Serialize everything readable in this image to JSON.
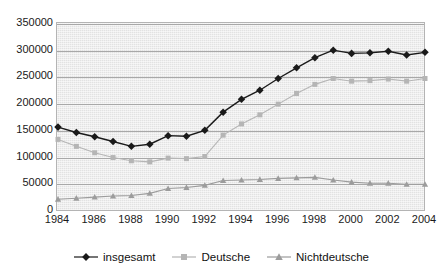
{
  "chart_data": {
    "type": "line",
    "title": "",
    "xlabel": "",
    "ylabel": "",
    "grid": true,
    "legend_position": "bottom",
    "xlim": [
      1984,
      2004
    ],
    "ylim": [
      0,
      350000
    ],
    "ytick_step": 50000,
    "xtick_step": 2,
    "x": [
      1984,
      1985,
      1986,
      1987,
      1988,
      1989,
      1990,
      1991,
      1992,
      1993,
      1994,
      1995,
      1996,
      1997,
      1998,
      1999,
      2000,
      2001,
      2002,
      2003,
      2004
    ],
    "xticklabels": [
      "1984",
      "1986",
      "1988",
      "1990",
      "1992",
      "1994",
      "1996",
      "1998",
      "2000",
      "2002",
      "2004"
    ],
    "yticklabels": [
      "0",
      "50000",
      "100000",
      "150000",
      "200000",
      "250000",
      "300000",
      "350000"
    ],
    "series": [
      {
        "name": "insgesamt",
        "color": "#1a1a1a",
        "marker": "diamond",
        "values": [
          157000,
          147000,
          139000,
          130000,
          121000,
          125000,
          141000,
          140000,
          151000,
          185000,
          209000,
          226000,
          248000,
          268000,
          287000,
          301000,
          295000,
          296000,
          299000,
          292000,
          297000
        ]
      },
      {
        "name": "Deutsche",
        "color": "#b5b5b5",
        "marker": "square",
        "values": [
          134000,
          121000,
          109000,
          100000,
          94000,
          92000,
          99000,
          98000,
          102000,
          142000,
          163000,
          180000,
          200000,
          220000,
          237000,
          248000,
          243000,
          244000,
          247000,
          243000,
          248000
        ]
      },
      {
        "name": "Nichtdeutsche",
        "color": "#9c9c9c",
        "marker": "triangle",
        "values": [
          22000,
          24000,
          26000,
          28000,
          29000,
          33000,
          42000,
          44000,
          48000,
          57000,
          58000,
          59000,
          61000,
          62000,
          63000,
          58000,
          54000,
          52000,
          52000,
          50000,
          50000
        ]
      }
    ]
  },
  "colors": {
    "plot_background": "#e2e2e2",
    "plot_border": "#b4b4b4",
    "gridline": "#a8a8a8",
    "axis_text": "#1a1a1a",
    "page_background": "#ffffff"
  }
}
